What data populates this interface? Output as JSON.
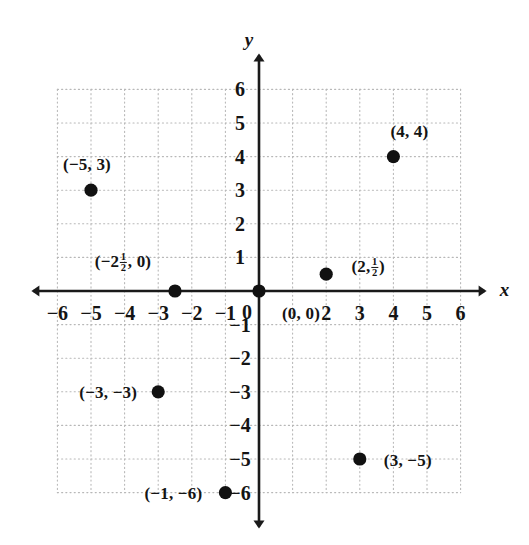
{
  "figure": {
    "kind": "cartesian-coordinate-plane",
    "background_color": "#ffffff",
    "axis_color": "#1a1a1a",
    "grid_color": "#b8b8b8",
    "point_color": "#111111",
    "axis_names": {
      "x": "x",
      "y": "y"
    },
    "grid": {
      "style": "dotted",
      "visible": true
    }
  },
  "chart_data": {
    "type": "scatter",
    "title": "",
    "xlabel": "x",
    "ylabel": "y",
    "xlim": [
      -6,
      6
    ],
    "ylim": [
      -6,
      6
    ],
    "grid": true,
    "legend": false,
    "xticks": [
      -6,
      -5,
      -4,
      -3,
      -2,
      -1,
      0,
      1,
      2,
      3,
      4,
      5,
      6
    ],
    "yticks": [
      -6,
      -5,
      -4,
      -3,
      -2,
      -1,
      0,
      1,
      2,
      3,
      4,
      5,
      6
    ],
    "xtick_labels": [
      "−6",
      "−5",
      "−4",
      "−3",
      "−2",
      "−1",
      "0",
      "",
      "2",
      "3",
      "4",
      "5",
      "6"
    ],
    "ytick_labels": [
      "−6",
      "−5",
      "−4",
      "−3",
      "−2",
      "−1",
      "0",
      "1",
      "2",
      "3",
      "4",
      "5",
      "6"
    ],
    "x": [
      -5,
      -2.5,
      0,
      2,
      4,
      -3,
      3,
      -1
    ],
    "y": [
      3,
      0,
      0,
      0.5,
      4,
      -3,
      -5,
      -6
    ],
    "point_labels": [
      "(−5, 3)",
      "(−2½, 0)",
      "(0, 0)",
      "(2, ½)",
      "(4, 4)",
      "(−3, −3)",
      "(3, −5)",
      "(−1, −6)"
    ]
  },
  "ticks": {
    "x": [
      {
        "value": -6,
        "text": "−6"
      },
      {
        "value": -5,
        "text": "−5"
      },
      {
        "value": -4,
        "text": "−4"
      },
      {
        "value": -3,
        "text": "−3"
      },
      {
        "value": -2,
        "text": "−2"
      },
      {
        "value": -1,
        "text": "−1"
      },
      {
        "value": 2,
        "text": "2"
      },
      {
        "value": 3,
        "text": "3"
      },
      {
        "value": 4,
        "text": "4"
      },
      {
        "value": 5,
        "text": "5"
      },
      {
        "value": 6,
        "text": "6"
      }
    ],
    "origin": {
      "value": 0,
      "text": "0"
    },
    "y": [
      {
        "value": 6,
        "text": "6"
      },
      {
        "value": 5,
        "text": "5"
      },
      {
        "value": 4,
        "text": "4"
      },
      {
        "value": 3,
        "text": "3"
      },
      {
        "value": 2,
        "text": "2"
      },
      {
        "value": 1,
        "text": "1"
      },
      {
        "value": -1,
        "text": "−1"
      },
      {
        "value": -2,
        "text": "−2"
      },
      {
        "value": -3,
        "text": "−3"
      },
      {
        "value": -4,
        "text": "−4"
      },
      {
        "value": -5,
        "text": "−5"
      },
      {
        "value": -6,
        "text": "−6"
      }
    ]
  },
  "points": [
    {
      "id": "minus5-3",
      "x": -5,
      "y": 3,
      "label_parts": {
        "pre": "(−5, 3)",
        "post": ""
      },
      "label_plain": "(−5, 3)",
      "label_dx": -4,
      "label_dy": -26,
      "label_anchor": "center"
    },
    {
      "id": "minus2half-0",
      "x": -2.5,
      "y": 0,
      "label_parts": {
        "pre": "(−2",
        "num": "1",
        "den": "2",
        "post": ", 0)"
      },
      "label_plain": "(−2 1/2, 0)",
      "label_dx": -52,
      "label_dy": -28,
      "label_anchor": "center"
    },
    {
      "id": "origin-0-0",
      "x": 0,
      "y": 0,
      "label_parts": {
        "pre": "(0, 0)",
        "post": ""
      },
      "label_plain": "(0, 0)",
      "label_dx": 42,
      "label_dy": 22,
      "label_anchor": "center"
    },
    {
      "id": "2-half",
      "x": 2,
      "y": 0.5,
      "label_parts": {
        "pre": "(2,",
        "num": "1",
        "den": "2",
        "post": ")"
      },
      "label_plain": "(2, 1/2)",
      "label_dx": 42,
      "label_dy": -6,
      "label_anchor": "center"
    },
    {
      "id": "4-4",
      "x": 4,
      "y": 4,
      "label_parts": {
        "pre": "(4, 4)",
        "post": ""
      },
      "label_plain": "(4, 4)",
      "label_dx": 16,
      "label_dy": -26,
      "label_anchor": "center"
    },
    {
      "id": "minus3-minus3",
      "x": -3,
      "y": -3,
      "label_parts": {
        "pre": "(−3, −3)",
        "post": ""
      },
      "label_plain": "(−3, −3)",
      "label_dx": -50,
      "label_dy": 0,
      "label_anchor": "center"
    },
    {
      "id": "3-minus5",
      "x": 3,
      "y": -5,
      "label_parts": {
        "pre": "(3, −5)",
        "post": ""
      },
      "label_plain": "(3, −5)",
      "label_dx": 48,
      "label_dy": 1,
      "label_anchor": "center"
    },
    {
      "id": "minus1-minus6",
      "x": -1,
      "y": -6,
      "label_parts": {
        "pre": "(−1, −6)",
        "post": ""
      },
      "label_plain": "(−1, −6)",
      "label_dx": -52,
      "label_dy": 0,
      "label_anchor": "center"
    }
  ]
}
